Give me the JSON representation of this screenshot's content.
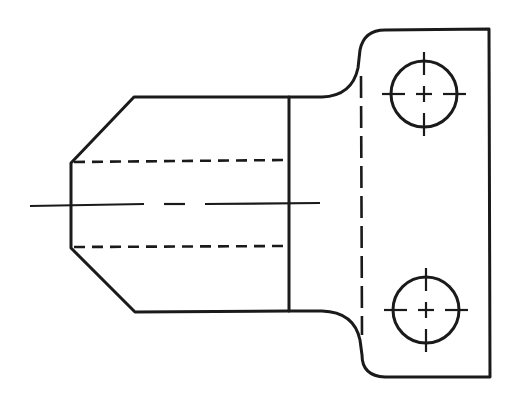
{
  "diagram": {
    "type": "technical-drawing",
    "line_color": "#1a1a1a",
    "background": "#ffffff",
    "elements": {
      "outline": "visible object lines (body + flange with fillets)",
      "boss_edge": "vertical visible line where boss meets flange",
      "flange_hidden_edge": "vertical hidden line inside flange",
      "bore_hidden_lines": [
        "upper bore hidden line",
        "lower bore hidden line"
      ],
      "axis_centerline": "horizontal centerline through boss",
      "holes": [
        {
          "name": "upper mounting hole",
          "cx": 424,
          "cy": 94,
          "r": 33
        },
        {
          "name": "lower mounting hole",
          "cx": 426,
          "cy": 310,
          "r": 33
        }
      ]
    }
  }
}
